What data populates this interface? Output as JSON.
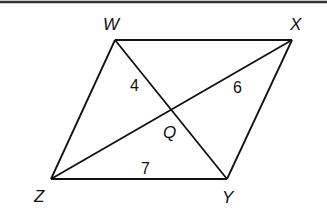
{
  "diagram": {
    "type": "parallelogram-with-diagonals",
    "colors": {
      "stroke": "#111111",
      "background": "#ffffff",
      "top_border": "#333333"
    },
    "vertices": [
      {
        "name": "W",
        "x": 115,
        "y": 40,
        "label_x": 103,
        "label_y": 30
      },
      {
        "name": "X",
        "x": 292,
        "y": 40,
        "label_x": 290,
        "label_y": 30
      },
      {
        "name": "Y",
        "x": 227,
        "y": 179,
        "label_x": 222,
        "label_y": 203
      },
      {
        "name": "Z",
        "x": 51,
        "y": 179,
        "label_x": 34,
        "label_y": 202
      }
    ],
    "intersection": {
      "name": "Q",
      "x": 172,
      "y": 110,
      "label_x": 163,
      "label_y": 138
    },
    "segment_labels": [
      {
        "segment": "WQ",
        "value": "4",
        "x": 130,
        "y": 91
      },
      {
        "segment": "XQ",
        "value": "6",
        "x": 233,
        "y": 93
      },
      {
        "segment": "ZY",
        "value": "7",
        "x": 141,
        "y": 174
      }
    ]
  }
}
